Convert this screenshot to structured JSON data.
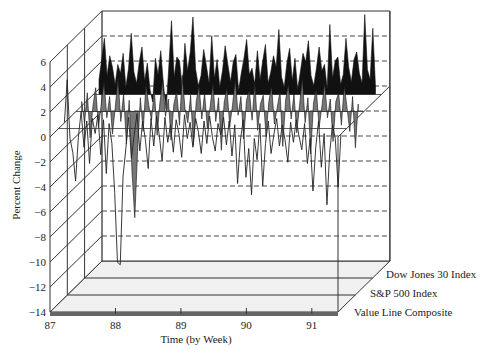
{
  "chart_data": {
    "type": "line",
    "subtype": "3d-ribbon",
    "title": "",
    "xlabel": "Time (by Week)",
    "ylabel": "Percent Change",
    "x_ticks": [
      "87",
      "88",
      "89",
      "90",
      "91"
    ],
    "y_ticks": [
      6,
      4,
      2,
      0,
      -2,
      -4,
      -6,
      -8,
      -10,
      -12,
      -14
    ],
    "ylim": [
      -14,
      6
    ],
    "xlim": [
      87,
      91.4
    ],
    "grid": "dashed horizontal on back wall",
    "legend_position": "right, depth axis",
    "series": [
      {
        "name": "Dow Jones 30 Index",
        "depth": 2,
        "style": "filled-black",
        "values": [
          1.2,
          2.8,
          4.5,
          1.5,
          3.1,
          2.2,
          0.8,
          2.4,
          1.7,
          3.3,
          0.6,
          2.1,
          4.9,
          1.8,
          0.9,
          2.6,
          3.8,
          1.1,
          2.5,
          0.4,
          -0.6,
          2.9,
          1.6,
          3.5,
          0.8,
          -1.2,
          2.2,
          5.9,
          1.4,
          3.0,
          2.7,
          0.5,
          4.1,
          1.9,
          3.4,
          6.2,
          2.0,
          0.7,
          1.5,
          3.6,
          2.3,
          0.9,
          4.7,
          1.3,
          2.8,
          0.6,
          1.9,
          3.9,
          2.4,
          1.0,
          2.6,
          3.2,
          0.3,
          1.7,
          2.9,
          4.4,
          1.6,
          2.1,
          0.8,
          3.5,
          1.2,
          2.7,
          4.0,
          0.9,
          1.8,
          3.1,
          2.2,
          5.2,
          1.4,
          0.6,
          2.5,
          3.7,
          1.1,
          2.9,
          0.4,
          1.8,
          3.3,
          2.6,
          4.3,
          1.5,
          0.7,
          2.1,
          3.8,
          1.9,
          2.4,
          0.5,
          5.6,
          1.3,
          2.7,
          3.0,
          0.8,
          1.6,
          4.5,
          2.2,
          1.0,
          2.8,
          3.4,
          1.7,
          0.9,
          6.4,
          2.0,
          1.2,
          5.3,
          0.6
        ]
      },
      {
        "name": "S&P 500 Index",
        "depth": 1,
        "style": "filled-gray",
        "values": [
          0.8,
          -0.9,
          1.5,
          -2.1,
          0.4,
          1.9,
          -1.3,
          0.6,
          2.4,
          -0.5,
          1.2,
          -1.8,
          0.3,
          2.7,
          -0.8,
          1.4,
          -2.6,
          0.9,
          -4.8,
          -8.5,
          -3.2,
          1.1,
          -1.6,
          2.2,
          0.5,
          -0.7,
          1.8,
          -1.9,
          0.7,
          2.5,
          -0.4,
          1.0,
          -2.3,
          0.6,
          1.6,
          -1.1,
          2.9,
          0.2,
          -0.9,
          1.3,
          -2.7,
          0.8,
          2.1,
          -0.6,
          1.5,
          -1.4,
          0.4,
          2.3,
          -0.8,
          1.1,
          -3.1,
          0.7,
          1.9,
          -1.2,
          0.5,
          2.6,
          -0.3,
          1.2,
          -2.2,
          0.9,
          1.7,
          -0.7,
          2.4,
          -1.5,
          0.6,
          1.3,
          -2.0,
          0.8,
          2.0,
          -1.0,
          0.3,
          1.6,
          -2.8,
          0.9,
          2.2,
          -0.6,
          1.4,
          -1.7,
          0.5,
          2.7,
          -0.9,
          1.1,
          -3.4,
          0.7,
          1.8,
          -1.3,
          0.4,
          2.3,
          -0.5,
          1.0,
          -2.4,
          0.8,
          1.5,
          -1.1,
          2.1,
          0.3,
          -1.6,
          1.2,
          -2.9,
          0.6
        ]
      },
      {
        "name": "Value Line Composite",
        "depth": 0,
        "style": "line",
        "values": [
          0.5,
          3.9,
          -0.8,
          -1.9,
          -4.2,
          -0.7,
          1.4,
          -1.5,
          0.6,
          -2.8,
          0.8,
          -0.4,
          1.1,
          -2.1,
          0.7,
          -3.6,
          0.4,
          -1.2,
          -5.1,
          -10.7,
          -10.9,
          -3.8,
          -1.6,
          0.9,
          -2.4,
          -0.5,
          1.2,
          -1.8,
          0.6,
          -0.9,
          -3.2,
          0.8,
          -1.4,
          1.0,
          -0.6,
          -2.6,
          0.9,
          -1.1,
          0.3,
          -1.9,
          0.7,
          -0.4,
          -2.3,
          1.1,
          -0.8,
          0.5,
          -1.5,
          0.8,
          -0.3,
          -2.0,
          0.6,
          -1.2,
          1.0,
          -0.7,
          -1.8,
          0.4,
          -0.5,
          0.9,
          -1.3,
          0.6,
          -2.2,
          0.3,
          -4.4,
          -1.0,
          0.7,
          -3.9,
          -1.6,
          -5.3,
          -0.8,
          -2.5,
          0.4,
          -4.6,
          -1.2,
          0.6,
          -2.0,
          -0.5,
          0.8,
          -1.4,
          0.3,
          -0.9,
          -2.7,
          0.5,
          -1.1,
          0.7,
          -0.6,
          -1.7,
          0.4,
          -2.8,
          -0.8,
          -5.0,
          -1.5,
          0.6,
          -3.1,
          -0.4,
          -6.1,
          -1.9,
          0.3,
          -0.8,
          -4.7,
          -0.5
        ]
      }
    ]
  },
  "axes": {
    "y_label": "Percent Change",
    "x_label": "Time (by Week)",
    "y_tick_labels": [
      "6",
      "4",
      "2",
      "0",
      "−2",
      "−4",
      "−6",
      "−8",
      "−10",
      "−12",
      "−14"
    ],
    "x_tick_labels": [
      "87",
      "88",
      "89",
      "90",
      "91"
    ]
  },
  "legend": {
    "items": [
      "Dow Jones 30 Index",
      "S&P 500 Index",
      "Value Line Composite"
    ]
  },
  "colors": {
    "dow_fill": "#111111",
    "sp_fill": "#777777",
    "line": "#222222",
    "frame": "#333333",
    "floor": "#f0f0f0",
    "base_strip": "#666666"
  }
}
